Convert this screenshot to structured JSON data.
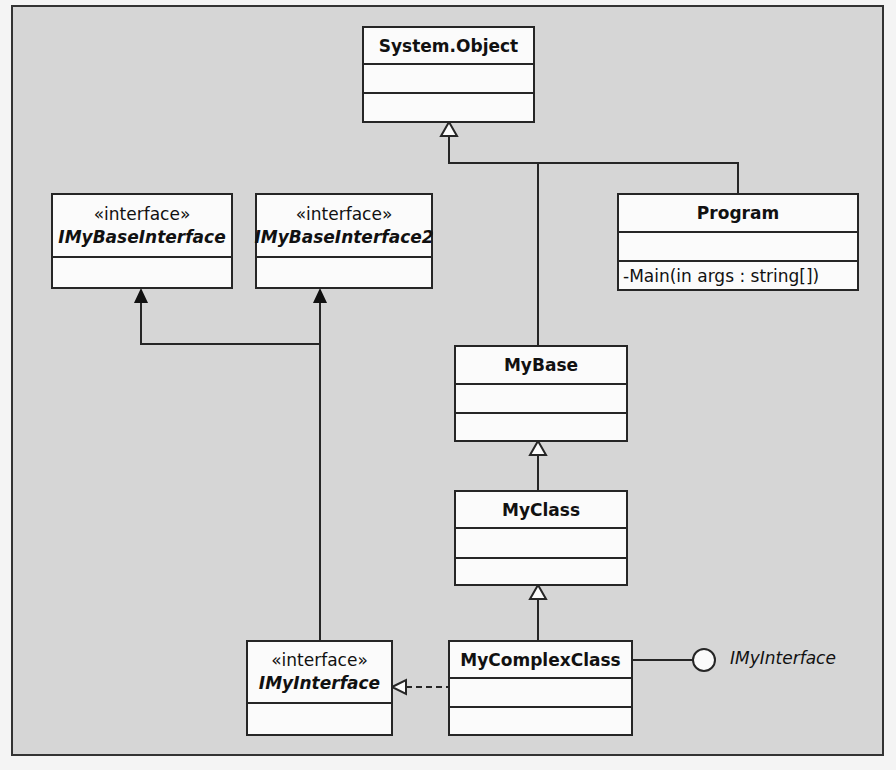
{
  "diagram": {
    "type": "UML class diagram",
    "classes": [
      {
        "id": "system-object",
        "name": "System.Object",
        "stereotype": null,
        "abstract_italic": false,
        "operations": []
      },
      {
        "id": "imybaseinterface",
        "name": "IMyBaseInterface",
        "stereotype": "«interface»",
        "abstract_italic": true,
        "operations": []
      },
      {
        "id": "imybaseinterface2",
        "name": "IMyBaseInterface2",
        "stereotype": "«interface»",
        "abstract_italic": true,
        "operations": []
      },
      {
        "id": "program",
        "name": "Program",
        "stereotype": null,
        "abstract_italic": false,
        "operations": [
          "-Main(in args : string[])"
        ]
      },
      {
        "id": "mybase",
        "name": "MyBase",
        "stereotype": null,
        "abstract_italic": false,
        "operations": []
      },
      {
        "id": "myclass",
        "name": "MyClass",
        "stereotype": null,
        "abstract_italic": false,
        "operations": []
      },
      {
        "id": "mycomplexclass",
        "name": "MyComplexClass",
        "stereotype": null,
        "abstract_italic": false,
        "operations": []
      },
      {
        "id": "imyinterface",
        "name": "IMyInterface",
        "stereotype": "«interface»",
        "abstract_italic": true,
        "operations": []
      }
    ],
    "relationships": [
      {
        "from": "MyBase",
        "to": "System.Object",
        "kind": "generalization"
      },
      {
        "from": "Program",
        "to": "System.Object",
        "kind": "generalization"
      },
      {
        "from": "MyClass",
        "to": "MyBase",
        "kind": "generalization"
      },
      {
        "from": "MyComplexClass",
        "to": "MyClass",
        "kind": "generalization"
      },
      {
        "from": "MyComplexClass",
        "to": "IMyInterface",
        "kind": "realization (dashed)"
      },
      {
        "from": "IMyInterface",
        "to": "IMyBaseInterface",
        "kind": "association (solid arrow)"
      },
      {
        "from": "IMyInterface",
        "to": "IMyBaseInterface2",
        "kind": "association (solid arrow)"
      },
      {
        "from": "MyComplexClass",
        "to": "IMyInterface",
        "kind": "lollipop interface"
      }
    ],
    "lollipop_label": "IMyInterface"
  },
  "labels": {
    "system_object": "System.Object",
    "imybaseinterface_stereo": "«interface»",
    "imybaseinterface": "IMyBaseInterface",
    "imybaseinterface2_stereo": "«interface»",
    "imybaseinterface2": "IMyBaseInterface2",
    "program": "Program",
    "program_op": "-Main(in args : string[])",
    "mybase": "MyBase",
    "myclass": "MyClass",
    "mycomplexclass": "MyComplexClass",
    "imyinterface_stereo": "«interface»",
    "imyinterface": "IMyInterface",
    "lollipop": "IMyInterface"
  },
  "colors": {
    "background": "#d6d6d6",
    "box_fill": "#fbfbfb",
    "line": "#262626"
  }
}
